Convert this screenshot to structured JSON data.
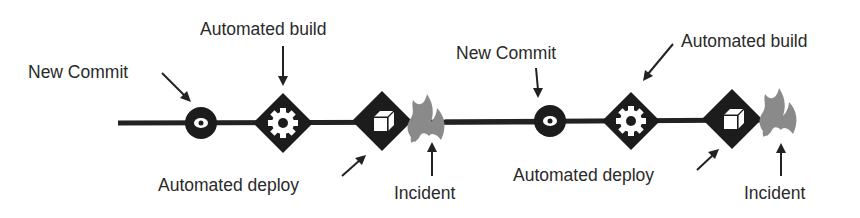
{
  "diagram": {
    "title": "",
    "colors": {
      "line": "#222222",
      "node": "#1c1c1c",
      "icon": "#ffffff",
      "flame": "#8a8a8a",
      "text": "#2a2a2a"
    },
    "cycles": [
      {
        "commit": {
          "label": "New Commit",
          "icon": "commit-icon"
        },
        "build": {
          "label": "Automated build",
          "icon": "gear-icon"
        },
        "deploy": {
          "label": "Automated deploy",
          "icon": "cube-icon"
        },
        "incident": {
          "label": "Incident",
          "icon": "flame-icon"
        }
      },
      {
        "commit": {
          "label": "New Commit",
          "icon": "commit-icon"
        },
        "build": {
          "label": "Automated build",
          "icon": "gear-icon"
        },
        "deploy": {
          "label": "Automated deploy",
          "icon": "cube-icon"
        },
        "incident": {
          "label": "Incident",
          "icon": "flame-icon"
        }
      }
    ]
  }
}
